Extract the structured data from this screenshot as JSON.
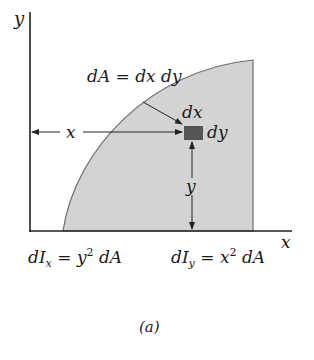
{
  "figure": {
    "caption": "(a)",
    "colors": {
      "region_fill": "#d3d3d3",
      "region_stroke": "#6e6e6e",
      "element_fill": "#555555",
      "axis": "#222222"
    },
    "axes": {
      "x_label": "x",
      "y_label": "y"
    },
    "annotations": {
      "dA_label": "dA = dx dy",
      "dx_label": "dx",
      "dy_label": "dy",
      "x_distance_label": "x",
      "y_distance_label": "y"
    },
    "formulas": {
      "dIx": {
        "lhs_main": "dI",
        "lhs_sub": "x",
        "rhs_var": "y",
        "rhs_exp": "2",
        "rhs_tail": "dA"
      },
      "dIy": {
        "lhs_main": "dI",
        "lhs_sub": "y",
        "rhs_var": "x",
        "rhs_exp": "2",
        "rhs_tail": "dA"
      }
    }
  }
}
